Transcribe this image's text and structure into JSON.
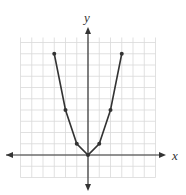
{
  "chart_data": {
    "type": "line",
    "title": "",
    "xlabel": "x",
    "ylabel": "y",
    "grid": true,
    "xlim": [
      -6,
      6
    ],
    "ylim": [
      -2,
      10
    ],
    "tick_labels_shown": false,
    "series": [
      {
        "name": "graph",
        "x": [
          -3,
          -2,
          -1,
          0,
          1,
          2,
          3
        ],
        "y": [
          9,
          4,
          1,
          0,
          1,
          4,
          9
        ],
        "markers": true
      }
    ]
  },
  "axes": {
    "x_label": "x",
    "y_label": "y"
  },
  "colors": {
    "grid": "#d9d9d9",
    "axis": "#333333",
    "curve": "#333333"
  }
}
